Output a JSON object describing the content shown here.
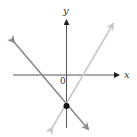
{
  "diagram": {
    "type": "coordinate-plane-lines",
    "axes": {
      "x_label": "x",
      "y_label": "y",
      "origin_label": "0"
    },
    "lines": [
      {
        "name": "dark-line",
        "color": "#8a8a8a",
        "slope_sign": "negative",
        "description": "line with negative slope through y-intercept point"
      },
      {
        "name": "light-line",
        "color": "#c8c8c8",
        "slope_sign": "positive",
        "description": "line with positive slope through y-intercept point"
      }
    ],
    "intersection_point": {
      "location": "on negative y-axis",
      "color": "#111111"
    },
    "colors": {
      "axis": "#555555",
      "background": "#ffffff"
    }
  }
}
